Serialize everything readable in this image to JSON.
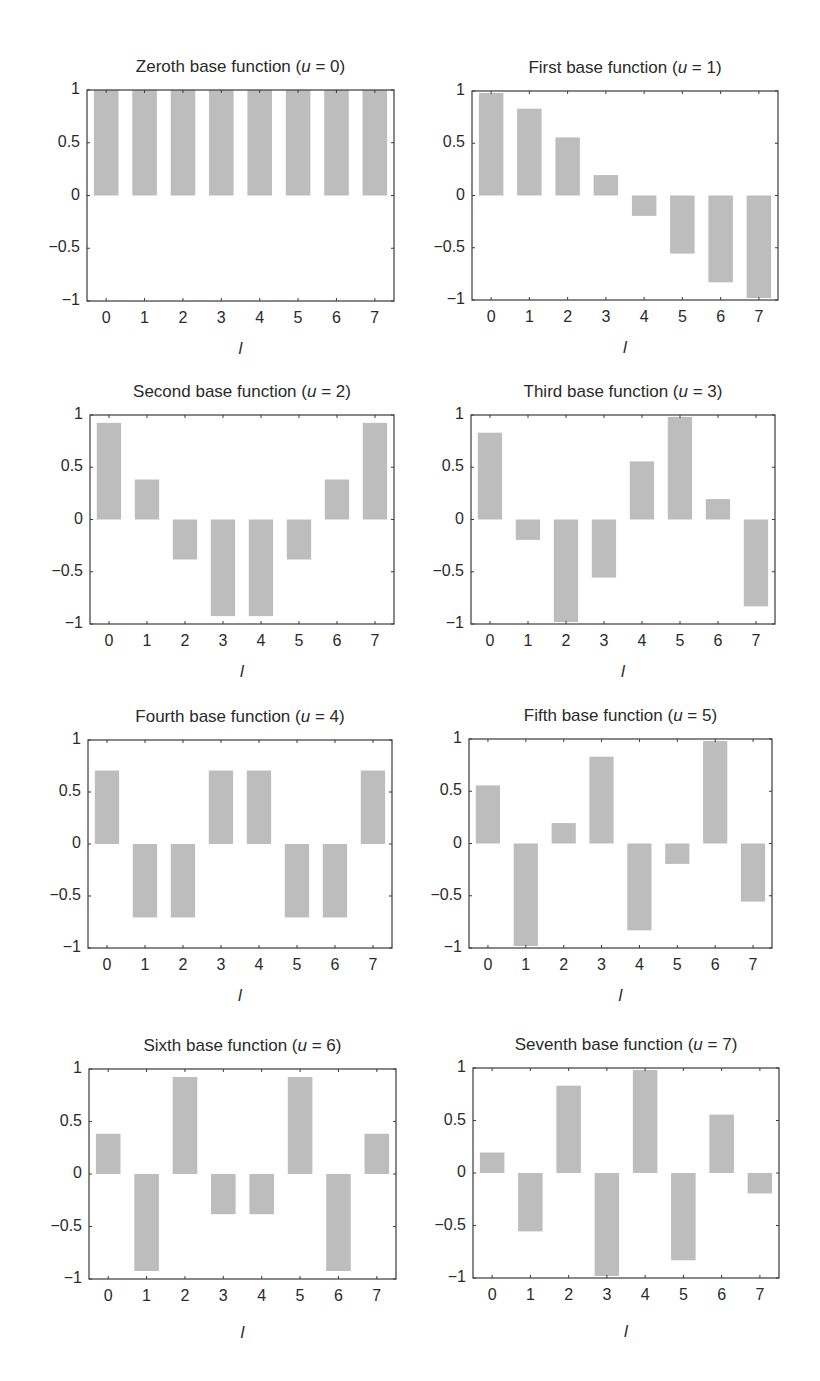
{
  "figure": {
    "background": "#ffffff",
    "bar_color": "#bdbdbd",
    "axis_color": "#3a3a3a"
  },
  "chart_data": [
    {
      "type": "bar",
      "title": "Zeroth base function (u = 0)",
      "title_prefix": "Zeroth base function (",
      "title_var": "u",
      "title_suffix": " = 0)",
      "xlabel": "l",
      "ylabel": "",
      "categories": [
        "0",
        "1",
        "2",
        "3",
        "4",
        "5",
        "6",
        "7"
      ],
      "values": [
        1,
        1,
        1,
        1,
        1,
        1,
        1,
        1
      ],
      "ylim": [
        -1,
        1
      ],
      "yticks": [
        "1",
        "0.5",
        "0",
        "−0.5",
        "−1"
      ],
      "grid": false
    },
    {
      "type": "bar",
      "title": "First base function (u = 1)",
      "title_prefix": "First base function (",
      "title_var": "u",
      "title_suffix": " = 1)",
      "xlabel": "l",
      "ylabel": "",
      "categories": [
        "0",
        "1",
        "2",
        "3",
        "4",
        "5",
        "6",
        "7"
      ],
      "values": [
        0.981,
        0.831,
        0.556,
        0.195,
        -0.195,
        -0.556,
        -0.831,
        -0.981
      ],
      "ylim": [
        -1,
        1
      ],
      "yticks": [
        "1",
        "0.5",
        "0",
        "−0.5",
        "−1"
      ],
      "grid": false
    },
    {
      "type": "bar",
      "title": "Second base function (u = 2)",
      "title_prefix": "Second base function (",
      "title_var": "u",
      "title_suffix": " = 2)",
      "xlabel": "l",
      "ylabel": "",
      "categories": [
        "0",
        "1",
        "2",
        "3",
        "4",
        "5",
        "6",
        "7"
      ],
      "values": [
        0.924,
        0.383,
        -0.383,
        -0.924,
        -0.924,
        -0.383,
        0.383,
        0.924
      ],
      "ylim": [
        -1,
        1
      ],
      "yticks": [
        "1",
        "0.5",
        "0",
        "−0.5",
        "−1"
      ],
      "grid": false
    },
    {
      "type": "bar",
      "title": "Third base function (u = 3)",
      "title_prefix": "Third base function (",
      "title_var": "u",
      "title_suffix": " = 3)",
      "xlabel": "l",
      "ylabel": "",
      "categories": [
        "0",
        "1",
        "2",
        "3",
        "4",
        "5",
        "6",
        "7"
      ],
      "values": [
        0.831,
        -0.195,
        -0.981,
        -0.556,
        0.556,
        0.981,
        0.195,
        -0.831
      ],
      "ylim": [
        -1,
        1
      ],
      "yticks": [
        "1",
        "0.5",
        "0",
        "−0.5",
        "−1"
      ],
      "grid": false
    },
    {
      "type": "bar",
      "title": "Fourth base function (u = 4)",
      "title_prefix": "Fourth base function (",
      "title_var": "u",
      "title_suffix": " = 4)",
      "xlabel": "l",
      "ylabel": "",
      "categories": [
        "0",
        "1",
        "2",
        "3",
        "4",
        "5",
        "6",
        "7"
      ],
      "values": [
        0.707,
        -0.707,
        -0.707,
        0.707,
        0.707,
        -0.707,
        -0.707,
        0.707
      ],
      "ylim": [
        -1,
        1
      ],
      "yticks": [
        "1",
        "0.5",
        "0",
        "−0.5",
        "−1"
      ],
      "grid": false
    },
    {
      "type": "bar",
      "title": "Fifth base function (u = 5)",
      "title_prefix": "Fifth base function (",
      "title_var": "u",
      "title_suffix": " = 5)",
      "xlabel": "l",
      "ylabel": "",
      "categories": [
        "0",
        "1",
        "2",
        "3",
        "4",
        "5",
        "6",
        "7"
      ],
      "values": [
        0.556,
        -0.981,
        0.195,
        0.831,
        -0.831,
        -0.195,
        0.981,
        -0.556
      ],
      "ylim": [
        -1,
        1
      ],
      "yticks": [
        "1",
        "0.5",
        "0",
        "−0.5",
        "−1"
      ],
      "grid": false
    },
    {
      "type": "bar",
      "title": "Sixth base function (u = 6)",
      "title_prefix": "Sixth base function (",
      "title_var": "u",
      "title_suffix": " = 6)",
      "xlabel": "l",
      "ylabel": "",
      "categories": [
        "0",
        "1",
        "2",
        "3",
        "4",
        "5",
        "6",
        "7"
      ],
      "values": [
        0.383,
        -0.924,
        0.924,
        -0.383,
        -0.383,
        0.924,
        -0.924,
        0.383
      ],
      "ylim": [
        -1,
        1
      ],
      "yticks": [
        "1",
        "0.5",
        "0",
        "−0.5",
        "−1"
      ],
      "grid": false
    },
    {
      "type": "bar",
      "title": "Seventh base function (u = 7)",
      "title_prefix": "Seventh base function (",
      "title_var": "u",
      "title_suffix": " = 7)",
      "xlabel": "l",
      "ylabel": "",
      "categories": [
        "0",
        "1",
        "2",
        "3",
        "4",
        "5",
        "6",
        "7"
      ],
      "values": [
        0.195,
        -0.556,
        0.831,
        -0.981,
        0.981,
        -0.831,
        0.556,
        -0.195
      ],
      "ylim": [
        -1,
        1
      ],
      "yticks": [
        "1",
        "0.5",
        "0",
        "−0.5",
        "−1"
      ],
      "grid": false
    }
  ],
  "layout": {
    "panels": [
      {
        "left": 87,
        "top": 90,
        "width": 307,
        "height": 211
      },
      {
        "left": 472,
        "top": 91,
        "width": 306,
        "height": 209
      },
      {
        "left": 90,
        "top": 415,
        "width": 304,
        "height": 209
      },
      {
        "left": 471,
        "top": 415,
        "width": 304,
        "height": 209
      },
      {
        "left": 88,
        "top": 740,
        "width": 304,
        "height": 208
      },
      {
        "left": 469,
        "top": 739,
        "width": 303,
        "height": 209
      },
      {
        "left": 89,
        "top": 1069,
        "width": 307,
        "height": 210
      },
      {
        "left": 473,
        "top": 1068,
        "width": 306,
        "height": 210
      }
    ],
    "bar_width_fraction": 0.64
  }
}
